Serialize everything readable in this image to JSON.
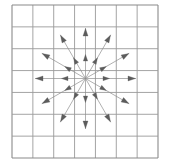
{
  "figure": {
    "canvas": {
      "width": 170,
      "height": 166,
      "background": "#ffffff"
    }
  },
  "grid": {
    "name": "square-grid",
    "columns": 7,
    "rows": 7,
    "x0": 12,
    "y0": 5,
    "x1": 158,
    "y1": 158,
    "cell_width": 20.857,
    "cell_height": 21.857,
    "line_color": "#9a9a9a",
    "line_width": 0.9,
    "border_color": "#8a8a8a",
    "border_width": 1.1,
    "x_lines": [
      12,
      32.86,
      53.71,
      74.57,
      95.43,
      116.29,
      137.14,
      158
    ],
    "y_lines": [
      5,
      26.86,
      48.71,
      70.57,
      92.43,
      114.29,
      136.14,
      158
    ]
  },
  "vector_field": {
    "name": "radial-arrows",
    "center_x": 85.5,
    "center_y": 78.5,
    "direction_count": 12,
    "angle_step_degrees": 30,
    "angles_degrees": [
      0,
      30,
      60,
      90,
      120,
      150,
      180,
      210,
      240,
      270,
      300,
      330
    ],
    "rings": [
      {
        "name": "inner-ring",
        "radius": 24,
        "head_length": 6.5,
        "head_width": 4.4
      },
      {
        "name": "outer-ring",
        "radius": 50,
        "head_length": 7.5,
        "head_width": 5.0
      }
    ],
    "line_color": "#8e8e8e",
    "line_width": 0.7,
    "arrow_color": "#5c5c5c"
  },
  "chart_data": {
    "type": "scatter",
    "xlabel": "",
    "ylabel": "",
    "xlim": [
      0,
      7
    ],
    "ylim": [
      0,
      7
    ],
    "grid": true,
    "legend_position": "none",
    "series": [
      {
        "name": "radial-vectors",
        "origin": [
          3.5,
          3.5
        ],
        "vectors": [
          {
            "angle_deg": 0,
            "dx": 1.0,
            "dy": 0.0,
            "magnitude": 1.0
          },
          {
            "angle_deg": 30,
            "dx": 0.866,
            "dy": 0.5,
            "magnitude": 1.0
          },
          {
            "angle_deg": 60,
            "dx": 0.5,
            "dy": 0.866,
            "magnitude": 1.0
          },
          {
            "angle_deg": 90,
            "dx": 0.0,
            "dy": 1.0,
            "magnitude": 1.0
          },
          {
            "angle_deg": 120,
            "dx": -0.5,
            "dy": 0.866,
            "magnitude": 1.0
          },
          {
            "angle_deg": 150,
            "dx": -0.866,
            "dy": 0.5,
            "magnitude": 1.0
          },
          {
            "angle_deg": 180,
            "dx": -1.0,
            "dy": 0.0,
            "magnitude": 1.0
          },
          {
            "angle_deg": 210,
            "dx": -0.866,
            "dy": -0.5,
            "magnitude": 1.0
          },
          {
            "angle_deg": 240,
            "dx": -0.5,
            "dy": -0.866,
            "magnitude": 1.0
          },
          {
            "angle_deg": 270,
            "dx": 0.0,
            "dy": -1.0,
            "magnitude": 1.0
          },
          {
            "angle_deg": 300,
            "dx": 0.5,
            "dy": -0.866,
            "magnitude": 1.0
          },
          {
            "angle_deg": 330,
            "dx": 0.866,
            "dy": -0.5,
            "magnitude": 1.0
          }
        ],
        "sample_radii": [
          1.15,
          2.4
        ]
      }
    ]
  }
}
